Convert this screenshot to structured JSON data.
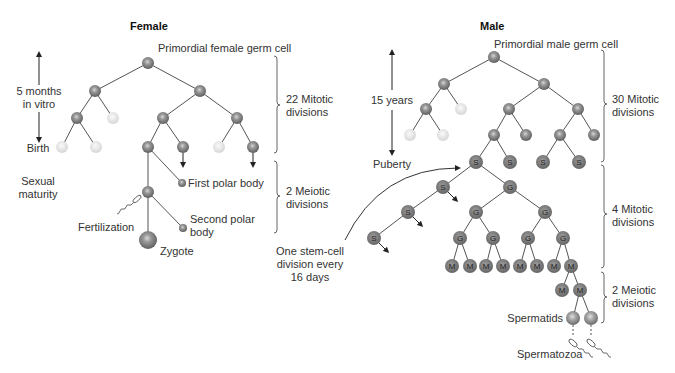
{
  "female": {
    "title": "Female",
    "root_label": "Primordial female germ cell",
    "timeline_top": "5 months",
    "timeline_bottom": "in vitro",
    "birth": "Birth",
    "sexual_maturity_1": "Sexual",
    "sexual_maturity_2": "maturity",
    "first_polar_body": "First polar body",
    "second_polar_body_1": "Second polar",
    "second_polar_body_2": "body",
    "fertilization": "Fertilization",
    "zygote": "Zygote",
    "brace_mitotic_1": "22 Mitotic",
    "brace_mitotic_2": "divisions",
    "brace_meiotic_1": "2 Meiotic",
    "brace_meiotic_2": "divisions"
  },
  "male": {
    "title": "Male",
    "root_label": "Primordial male germ cell",
    "timeline": "15 years",
    "puberty": "Puberty",
    "stem_note_1": "One stem-cell",
    "stem_note_2": "division every",
    "stem_note_3": "16 days",
    "spermatids": "Spermatids",
    "spermatozoa": "Spermatozoa",
    "brace_mitotic30_1": "30 Mitotic",
    "brace_mitotic30_2": "divisions",
    "brace_mitotic4_1": "4 Mitotic",
    "brace_mitotic4_2": "divisions",
    "brace_meiotic_1": "2 Meiotic",
    "brace_meiotic_2": "divisions",
    "node_letters": {
      "stem": "S",
      "gonial": "G",
      "meiotic": "M"
    }
  },
  "colors": {
    "node_dark": "#7a7a7a",
    "node_pale": "#e6e6e6",
    "node_letter": "#6e6e6e",
    "line": "#555555"
  }
}
